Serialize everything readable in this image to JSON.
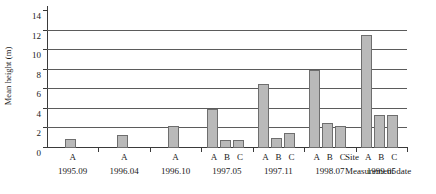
{
  "chart_data": {
    "type": "bar",
    "title": "",
    "xlabel": "Measurement date",
    "ylabel": "Mean height (m)",
    "site_axis_label": "Site",
    "ylim": [
      0,
      14
    ],
    "yticks": [
      0,
      2,
      4,
      6,
      8,
      10,
      12,
      14
    ],
    "ytick_labels": [
      "0",
      "2",
      "4",
      "6",
      "8",
      "10",
      "12",
      "14"
    ],
    "grid": "horizontal",
    "legend": "none",
    "categories": [
      "1995.09",
      "1996.04",
      "1996.10",
      "1997.05",
      "1997.11",
      "1998.07",
      "1999.05"
    ],
    "sites": [
      "A",
      "B",
      "C"
    ],
    "groups": [
      {
        "date": "1995.09",
        "sites": [
          "A"
        ],
        "values": [
          0.9
        ]
      },
      {
        "date": "1996.04",
        "sites": [
          "A"
        ],
        "values": [
          1.3
        ]
      },
      {
        "date": "1996.10",
        "sites": [
          "A"
        ],
        "values": [
          2.2
        ]
      },
      {
        "date": "1997.05",
        "sites": [
          "A",
          "B",
          "C"
        ],
        "values": [
          4.0,
          0.85,
          0.85
        ]
      },
      {
        "date": "1997.11",
        "sites": [
          "A",
          "B",
          "C"
        ],
        "values": [
          6.5,
          1.0,
          1.5
        ]
      },
      {
        "date": "1998.07",
        "sites": [
          "A",
          "B",
          "C"
        ],
        "values": [
          8.0,
          2.6,
          2.2
        ]
      },
      {
        "date": "1999.05",
        "sites": [
          "A",
          "B",
          "C"
        ],
        "values": [
          11.6,
          3.4,
          3.4
        ]
      }
    ],
    "series": [
      {
        "name": "A",
        "values": [
          0.9,
          1.3,
          2.2,
          4.0,
          6.5,
          8.0,
          11.6
        ]
      },
      {
        "name": "B",
        "values": [
          null,
          null,
          null,
          0.85,
          1.0,
          2.6,
          3.4
        ]
      },
      {
        "name": "C",
        "values": [
          null,
          null,
          null,
          0.85,
          1.5,
          2.2,
          3.4
        ]
      }
    ],
    "colors": {
      "bar_fill": "#b9b9b9",
      "bar_border": "#6e6e6e",
      "gridline": "#5b5b5b",
      "axis": "#3a3a3a",
      "text": "#1a1a1a",
      "background": "#ffffff"
    }
  }
}
